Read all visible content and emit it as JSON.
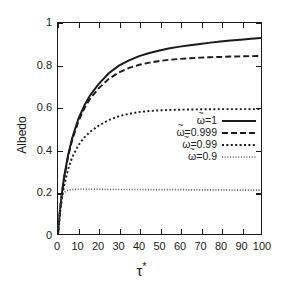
{
  "chart_data": {
    "type": "line",
    "title": "",
    "xlabel": "τ*",
    "ylabel": "Albedo",
    "xlim": [
      0,
      100
    ],
    "ylim": [
      0,
      1
    ],
    "grid": false,
    "legend_position": "center-right",
    "xticks": [
      "0",
      "10",
      "20",
      "30",
      "40",
      "50",
      "60",
      "70",
      "80",
      "90",
      "100"
    ],
    "xtick_values": [
      0,
      10,
      20,
      30,
      40,
      50,
      60,
      70,
      80,
      90,
      100
    ],
    "yticks": [
      "0",
      "0.2",
      "0.4",
      "0.6",
      "0.8",
      "1"
    ],
    "ytick_values": [
      0,
      0.2,
      0.4,
      0.6,
      0.8,
      1
    ],
    "series": [
      {
        "name": "ω̃=1",
        "omega_value": "1",
        "linestyle": "solid",
        "color": "#1a1a1a",
        "x": [
          0,
          1,
          2,
          3,
          5,
          7,
          10,
          13,
          16,
          20,
          25,
          30,
          35,
          40,
          45,
          50,
          55,
          60,
          65,
          70,
          75,
          80,
          85,
          90,
          95,
          100
        ],
        "values": [
          0,
          0.115,
          0.2,
          0.27,
          0.375,
          0.455,
          0.545,
          0.61,
          0.66,
          0.71,
          0.762,
          0.798,
          0.823,
          0.843,
          0.858,
          0.87,
          0.88,
          0.888,
          0.895,
          0.901,
          0.907,
          0.912,
          0.917,
          0.921,
          0.925,
          0.929
        ]
      },
      {
        "name": "ω̃=0.999",
        "omega_value": "0.999",
        "linestyle": "dashed",
        "color": "#1a1a1a",
        "x": [
          0,
          1,
          2,
          3,
          5,
          7,
          10,
          13,
          16,
          20,
          25,
          30,
          35,
          40,
          45,
          50,
          55,
          60,
          65,
          70,
          75,
          80,
          85,
          90,
          95,
          100
        ],
        "values": [
          0,
          0.113,
          0.196,
          0.265,
          0.368,
          0.446,
          0.533,
          0.596,
          0.644,
          0.69,
          0.735,
          0.766,
          0.787,
          0.802,
          0.812,
          0.82,
          0.826,
          0.83,
          0.833,
          0.836,
          0.838,
          0.839,
          0.841,
          0.842,
          0.843,
          0.844
        ]
      },
      {
        "name": "ω̃=0.99",
        "omega_value": "0.99",
        "linestyle": "dotted",
        "color": "#1a1a1a",
        "x": [
          0,
          1,
          2,
          3,
          5,
          7,
          10,
          13,
          16,
          20,
          25,
          30,
          35,
          40,
          45,
          50,
          55,
          60,
          65,
          70,
          75,
          80,
          85,
          90,
          95,
          100
        ],
        "values": [
          0,
          0.1,
          0.172,
          0.228,
          0.308,
          0.364,
          0.42,
          0.458,
          0.486,
          0.513,
          0.54,
          0.558,
          0.57,
          0.578,
          0.583,
          0.586,
          0.588,
          0.589,
          0.59,
          0.591,
          0.591,
          0.592,
          0.592,
          0.592,
          0.592,
          0.592
        ]
      },
      {
        "name": "ω̃=0.9",
        "omega_value": "0.9",
        "linestyle": "fine-dotted",
        "color": "#5a5a5a",
        "x": [
          0,
          0.5,
          1,
          1.5,
          2,
          3,
          4,
          5,
          6,
          8,
          10,
          15,
          20,
          30,
          40,
          50,
          60,
          70,
          80,
          90,
          100
        ],
        "values": [
          0,
          0.085,
          0.137,
          0.165,
          0.181,
          0.197,
          0.204,
          0.207,
          0.209,
          0.211,
          0.212,
          0.212,
          0.212,
          0.211,
          0.211,
          0.21,
          0.21,
          0.209,
          0.209,
          0.208,
          0.208
        ]
      }
    ]
  },
  "legend": {
    "items": [
      {
        "symbol": "ω",
        "tilde": "~",
        "eq": "=",
        "value": "1",
        "label": "ω̃=1",
        "style": "solid"
      },
      {
        "symbol": "ω",
        "tilde": "~",
        "eq": "=",
        "value": "0.999",
        "label": "ω̃=0.999",
        "style": "dashed"
      },
      {
        "symbol": "ω",
        "tilde": "~",
        "eq": "=",
        "value": "0.99",
        "label": "ω̃=0.99",
        "style": "dotted"
      },
      {
        "symbol": "ω",
        "tilde": "~",
        "eq": "=",
        "value": "0.9",
        "label": "ω̃=0.9",
        "style": "fine-dotted"
      }
    ]
  },
  "axes": {
    "x_title_base": "τ",
    "x_title_star": "*",
    "y_title": "Albedo"
  }
}
